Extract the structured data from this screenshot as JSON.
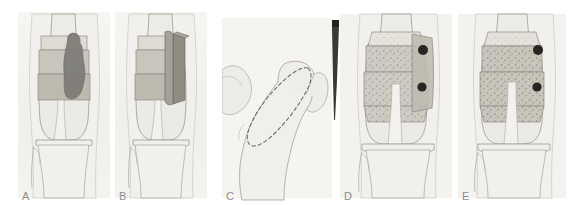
{
  "figure": {
    "width": 569,
    "height": 205,
    "background": "#ffffff"
  },
  "palette": {
    "paper": "#f3f2ef",
    "bone_fill": "#eceae5",
    "bone_outline": "#9b9a96",
    "soft_tissue": "#efeeea",
    "cortex_line": "#8f8e8a",
    "graft_light": "#d8d5cd",
    "graft_mid": "#c3bfb5",
    "graft_dark": "#a9a49a",
    "tumour": "#7d7b76",
    "plate": "#b5b1a7",
    "screw": "#262524",
    "osteotome": "#3a3937",
    "dashed_line": "#6f6e6a",
    "label_text": "#8d8d8d"
  },
  "panels": [
    {
      "id": "A",
      "label": "A",
      "caption": "Distal femur with intramedullary tumour lesion outlined",
      "x": 18,
      "width": 92,
      "features": [
        "femur",
        "tumour-lesion",
        "resection-bands",
        "knee-joint",
        "tibia",
        "fibula"
      ]
    },
    {
      "id": "B",
      "label": "B",
      "caption": "En bloc resection block of the involved distal femoral segment",
      "x": 115,
      "width": 92,
      "features": [
        "femur",
        "resection-block",
        "resection-bands",
        "knee-joint",
        "tibia",
        "fibula"
      ]
    },
    {
      "id": "C",
      "label": "C",
      "caption": "Proximal femur / hip donor site with dashed graft harvest outline",
      "x": 222,
      "width": 110,
      "features": [
        "pelvis",
        "femoral-head",
        "greater-trochanter",
        "graft-harvest-outline"
      ]
    },
    {
      "id": "D",
      "label": "D",
      "caption": "Allograft fitted to the defect and secured with a lateral plate and screws",
      "x": 340,
      "width": 112,
      "features": [
        "femur",
        "cancellous-allograft",
        "lateral-plate",
        "screws",
        "knee-joint",
        "tibia",
        "fibula"
      ]
    },
    {
      "id": "E",
      "label": "E",
      "caption": "Completed reconstruction with incorporated graft and fixation",
      "x": 458,
      "width": 108,
      "features": [
        "femur",
        "cancellous-allograft",
        "screws",
        "knee-joint",
        "tibia",
        "fibula"
      ]
    }
  ],
  "instrument": {
    "name": "osteotome",
    "label": "osteotome",
    "x": 330,
    "y": 20,
    "width": 9,
    "height": 100,
    "color": "#3a3937"
  },
  "screws": {
    "count_per_panel": 2,
    "radius": 5,
    "color": "#262524"
  }
}
